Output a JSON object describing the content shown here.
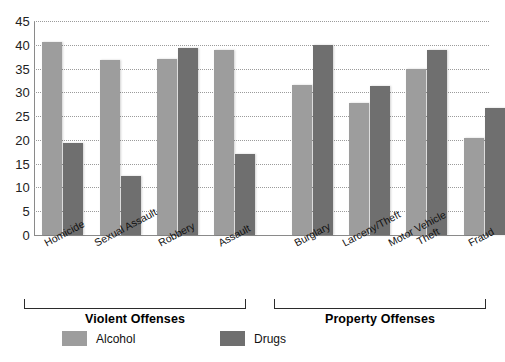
{
  "chart_data": {
    "type": "bar",
    "title": "",
    "xlabel": "",
    "ylabel": "",
    "ylim": [
      0,
      45
    ],
    "yticks": [
      0,
      5,
      10,
      15,
      20,
      25,
      30,
      35,
      40,
      45
    ],
    "grid": true,
    "legend_position": "bottom-left",
    "categories": [
      "Homicide",
      "Sexual Assault",
      "Robbery",
      "Assault",
      "Burglary",
      "Larceny/Theft",
      "Motor Vehicle Theft",
      "Fraud"
    ],
    "series": [
      {
        "name": "Alcohol",
        "color": "#9d9d9d",
        "values": [
          40.6,
          36.8,
          37.0,
          39.0,
          31.5,
          27.8,
          35.0,
          20.5
        ]
      },
      {
        "name": "Drugs",
        "color": "#6f6f6f",
        "values": [
          19.3,
          12.5,
          39.3,
          17.0,
          40.0,
          31.3,
          39.0,
          26.8
        ]
      }
    ],
    "groups": [
      {
        "label": "Violent Offenses",
        "categories": [
          "Homicide",
          "Sexual Assault",
          "Robbery",
          "Assault"
        ]
      },
      {
        "label": "Property Offenses",
        "categories": [
          "Burglary",
          "Larceny/Theft",
          "Motor Vehicle Theft",
          "Fraud"
        ]
      }
    ]
  },
  "axis": {
    "ytick_labels": [
      "45",
      "40",
      "35",
      "30",
      "25",
      "20",
      "15",
      "10",
      "5",
      "0"
    ]
  },
  "xaxis": {
    "labels": [
      {
        "line1": "Homicide",
        "line2": ""
      },
      {
        "line1": "Sexual Assault",
        "line2": ""
      },
      {
        "line1": "Robbery",
        "line2": ""
      },
      {
        "line1": "Assault",
        "line2": ""
      },
      {
        "line1": "Burglary",
        "line2": ""
      },
      {
        "line1": "Larceny/Theft",
        "line2": ""
      },
      {
        "line1": "Motor Vehicle",
        "line2": "Theft"
      },
      {
        "line1": "Fraud",
        "line2": ""
      }
    ]
  },
  "panels": {
    "violent_title": "Violent Offenses",
    "property_title": "Property Offenses"
  },
  "legend": {
    "items": [
      {
        "label": "Alcohol",
        "color": "#9d9d9d"
      },
      {
        "label": "Drugs",
        "color": "#6f6f6f"
      }
    ]
  },
  "caption": {
    "text": ""
  }
}
